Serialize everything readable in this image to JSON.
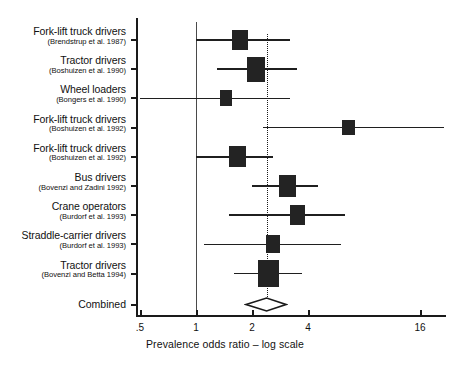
{
  "chart_data": {
    "type": "forest",
    "title": "",
    "xlabel": "Prevalence odds ratio – log scale",
    "ylabel": "",
    "scale": "log",
    "xticks": [
      0.5,
      1,
      2,
      4,
      16
    ],
    "xtick_labels": [
      ".5",
      "1",
      "2",
      "4",
      "16"
    ],
    "xlim": [
      0.45,
      22
    ],
    "grid": false,
    "legend": "none",
    "null_value": 1,
    "pooled_value": 2.4,
    "combined_label": "Combined",
    "combined": {
      "estimate": 2.4,
      "ci_low": 1.86,
      "ci_high": 3.05
    },
    "studies": [
      {
        "name": "Fork-lift truck drivers",
        "reference": "(Brendstrup et al. 1987)",
        "estimate": 1.73,
        "ci_low": 1.0,
        "ci_high": 3.2,
        "weight": 0.55
      },
      {
        "name": "Tractor drivers",
        "reference": "(Boshuizen et al. 1990)",
        "estimate": 2.1,
        "ci_low": 1.3,
        "ci_high": 3.5,
        "weight": 0.82
      },
      {
        "name": "Wheel loaders",
        "reference": "(Bongers et al. 1990)",
        "estimate": 1.45,
        "ci_low": 0.5,
        "ci_high": 3.2,
        "weight": 0.3
      },
      {
        "name": "Fork-lift truck drivers",
        "reference": "(Boshuizen et al. 1992)",
        "estimate": 6.6,
        "ci_low": 2.3,
        "ci_high": 22.0,
        "weight": 0.28
      },
      {
        "name": "Fork-lift truck drivers",
        "reference": "(Boshuizen et al. 1992)",
        "estimate": 1.67,
        "ci_low": 1.0,
        "ci_high": 2.6,
        "weight": 0.6
      },
      {
        "name": "Bus drivers",
        "reference": "(Bovenzi and Zadini 1992)",
        "estimate": 3.1,
        "ci_low": 2.0,
        "ci_high": 4.5,
        "weight": 0.62
      },
      {
        "name": "Crane operators",
        "reference": "(Burdorf et al. 1993)",
        "estimate": 3.5,
        "ci_low": 1.5,
        "ci_high": 6.3,
        "weight": 0.5
      },
      {
        "name": "Straddle-carrier drivers",
        "reference": "(Burdorf et al. 1993)",
        "estimate": 2.6,
        "ci_low": 1.1,
        "ci_high": 6.0,
        "weight": 0.42
      },
      {
        "name": "Tractor drivers",
        "reference": "(Bovenzi and Betta 1994)",
        "estimate": 2.45,
        "ci_low": 1.6,
        "ci_high": 3.7,
        "weight": 0.95
      }
    ]
  }
}
